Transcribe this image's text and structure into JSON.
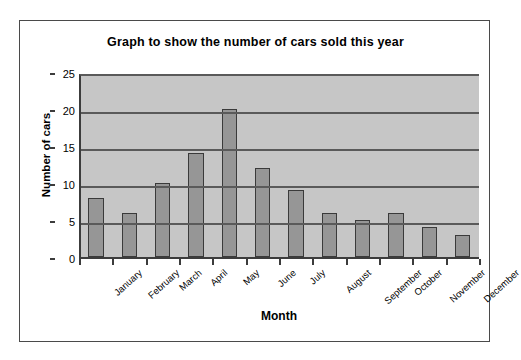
{
  "chart_data": {
    "type": "bar",
    "title": "Graph to show the number of cars sold this year",
    "xlabel": "Month",
    "ylabel": "Number of cars",
    "categories": [
      "January",
      "February",
      "March",
      "April",
      "May",
      "June",
      "July",
      "August",
      "September",
      "October",
      "November",
      "December"
    ],
    "values": [
      8,
      6,
      10,
      14,
      20,
      12,
      9,
      6,
      5,
      6,
      4,
      3
    ],
    "ylim": [
      0,
      25
    ],
    "ytick_labels": [
      "0",
      "5",
      "10",
      "15",
      "20",
      "25"
    ],
    "ytick_values": [
      0,
      5,
      10,
      15,
      20,
      25
    ],
    "grid": "horizontal",
    "legend": "none",
    "colors": {
      "bar_fill": "#969696",
      "bar_border": "#3a3a3a",
      "plot_background": "#c6c6c6",
      "gridline": "#5a5a5a",
      "axis": "#3c3c3c",
      "frame_border": "#4a4a4a",
      "page_background": "#ffffff",
      "text": "#000000"
    }
  }
}
